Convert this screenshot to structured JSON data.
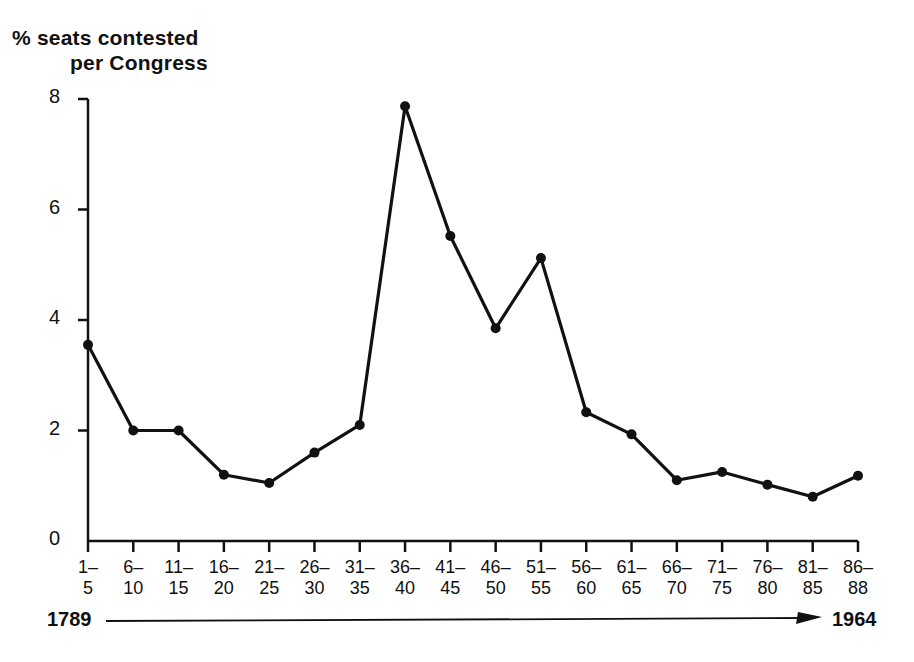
{
  "figure": {
    "title_line_1": "% seats contested",
    "title_line_2": "per Congress",
    "background_color": "#ffffff",
    "ink_color": "#111111"
  },
  "timeline": {
    "start_label": "1789",
    "end_label": "1964",
    "arrow_direction": "right"
  },
  "chart_data": {
    "type": "line",
    "title": "% seats contested per Congress",
    "xlabel": "",
    "ylabel": "% seats contested per Congress",
    "grid": false,
    "legend": false,
    "marker": "filled-circle",
    "line_color": "#111111",
    "ylim": [
      0,
      8
    ],
    "yticks": [
      0,
      2,
      4,
      6,
      8
    ],
    "ytick_labels": [
      "0",
      "2",
      "4",
      "6",
      "8"
    ],
    "categories": [
      "1-5",
      "6-10",
      "11-15",
      "16-20",
      "21-25",
      "26-30",
      "31-35",
      "36-40",
      "41-45",
      "46-50",
      "51-55",
      "56-60",
      "61-65",
      "66-70",
      "71-75",
      "76-80",
      "81-85",
      "86-88"
    ],
    "category_labels": [
      {
        "top": "1–",
        "bottom": "5"
      },
      {
        "top": "6–",
        "bottom": "10"
      },
      {
        "top": "11–",
        "bottom": "15"
      },
      {
        "top": "16–",
        "bottom": "20"
      },
      {
        "top": "21–",
        "bottom": "25"
      },
      {
        "top": "26–",
        "bottom": "30"
      },
      {
        "top": "31–",
        "bottom": "35"
      },
      {
        "top": "36–",
        "bottom": "40"
      },
      {
        "top": "41–",
        "bottom": "45"
      },
      {
        "top": "46–",
        "bottom": "50"
      },
      {
        "top": "51–",
        "bottom": "55"
      },
      {
        "top": "56–",
        "bottom": "60"
      },
      {
        "top": "61–",
        "bottom": "65"
      },
      {
        "top": "66–",
        "bottom": "70"
      },
      {
        "top": "71–",
        "bottom": "75"
      },
      {
        "top": "76–",
        "bottom": "80"
      },
      {
        "top": "81–",
        "bottom": "85"
      },
      {
        "top": "86–",
        "bottom": "88"
      }
    ],
    "values": [
      3.55,
      2.0,
      2.0,
      1.2,
      1.05,
      1.6,
      2.1,
      7.87,
      5.52,
      3.85,
      5.12,
      2.33,
      1.93,
      1.1,
      1.25,
      1.02,
      0.8,
      1.18
    ]
  }
}
